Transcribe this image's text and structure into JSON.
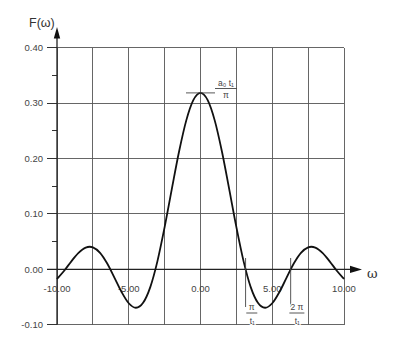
{
  "chart_data": {
    "type": "line",
    "title": "",
    "xlabel": "ω",
    "ylabel": "F(ω)",
    "xlim": [
      -10,
      10
    ],
    "ylim": [
      -0.1,
      0.4
    ],
    "grid": true,
    "grid_step_x": 2.5,
    "grid_step_y": 0.1,
    "legend": null,
    "x_ticks": [
      -10,
      -5,
      0,
      5,
      10
    ],
    "x_tick_labels": [
      "-10.00",
      "-5.00",
      "0.00",
      "5.00",
      "10.00"
    ],
    "y_ticks": [
      0.4,
      0.3,
      0.2,
      0.1,
      0.0,
      -0.1
    ],
    "y_tick_labels": [
      "0.40",
      "0.30",
      "0.20",
      "0.10",
      "0.00",
      "-0.10"
    ],
    "y_minor_ticks": [
      0.35,
      0.25,
      0.15,
      0.05
    ],
    "series": [
      {
        "name": "F(ω)",
        "x": [
          -10,
          -9.5,
          -9,
          -8.5,
          -8,
          -7.5,
          -7,
          -6.5,
          -6,
          -5.5,
          -5,
          -4.5,
          -4,
          -3.5,
          -3,
          -2.5,
          -2,
          -1.5,
          -1,
          -0.5,
          0,
          0.5,
          1,
          1.5,
          2,
          2.5,
          3,
          3.5,
          4,
          4.5,
          5,
          5.5,
          6,
          6.5,
          7,
          7.5,
          8,
          8.5,
          9,
          9.5,
          10
        ],
        "y": [
          -0.01732,
          -0.00252,
          0.01458,
          0.0299,
          0.03937,
          0.03981,
          0.02988,
          0.01054,
          -0.01482,
          -0.04083,
          -0.06105,
          -0.06915,
          -0.06023,
          -0.0319,
          0.01497,
          0.0762,
          0.14472,
          0.21167,
          0.26785,
          0.30521,
          0.31831,
          0.30521,
          0.26785,
          0.21167,
          0.14472,
          0.0762,
          0.01497,
          -0.0319,
          -0.06023,
          -0.06915,
          -0.06105,
          -0.04083,
          -0.01482,
          0.01054,
          0.02988,
          0.03981,
          0.03937,
          0.0299,
          0.01458,
          -0.00252,
          -0.01732
        ]
      }
    ],
    "annotations": [
      {
        "kind": "peak",
        "x": 0,
        "y": 0.3183,
        "numerator": "a₀ t₁",
        "denominator": "π"
      },
      {
        "kind": "zero-marker",
        "x": 3.1416,
        "y": 0,
        "numerator": "π",
        "denominator": "t₁"
      },
      {
        "kind": "zero-marker",
        "x": 6.2832,
        "y": 0,
        "numerator": "2 π",
        "denominator": "t₁"
      }
    ]
  }
}
